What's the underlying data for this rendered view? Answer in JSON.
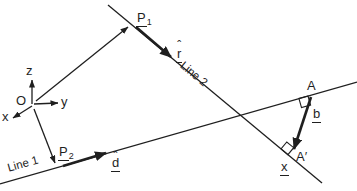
{
  "canvas": {
    "background": "#ffffff",
    "ink": "#1f1f1f"
  },
  "axes": {
    "origin": "O",
    "x": "x",
    "y": "y",
    "z": "z"
  },
  "points": {
    "p1": {
      "base": "P",
      "sub": "1"
    },
    "p2": {
      "base": "P",
      "sub": "2"
    },
    "a": "A",
    "a_prime": "A′"
  },
  "vectors": {
    "r": {
      "base": "r",
      "hat": "ˆ"
    },
    "d": {
      "base": "d",
      "hat": "ˆ"
    },
    "b": "b",
    "x": "x"
  },
  "line_labels": {
    "line1": "Line 1",
    "line2": "Line 2"
  }
}
